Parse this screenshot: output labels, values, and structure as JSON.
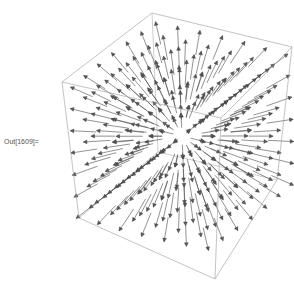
{
  "cell": {
    "output_label": "Out[1609]="
  },
  "plot": {
    "type": "VectorPlot3D",
    "field": "radial outward",
    "grid_size": 7,
    "box": {
      "top_back": [
        152,
        13
      ],
      "left_top": [
        62,
        82
      ],
      "right_top": [
        292,
        47
      ],
      "front_top": [
        221,
        118
      ],
      "left_bottom": [
        79,
        218
      ],
      "right_bottom": [
        277,
        180
      ],
      "front_bottom": [
        215,
        279
      ],
      "back_bottom": [
        158,
        152
      ]
    },
    "center": [
      180,
      135
    ],
    "colors": {
      "box_edge": "#9a9a9a",
      "arrow": "#4a4a4a",
      "arrow_head": "#5a5a5a",
      "background": "#ffffff"
    }
  }
}
